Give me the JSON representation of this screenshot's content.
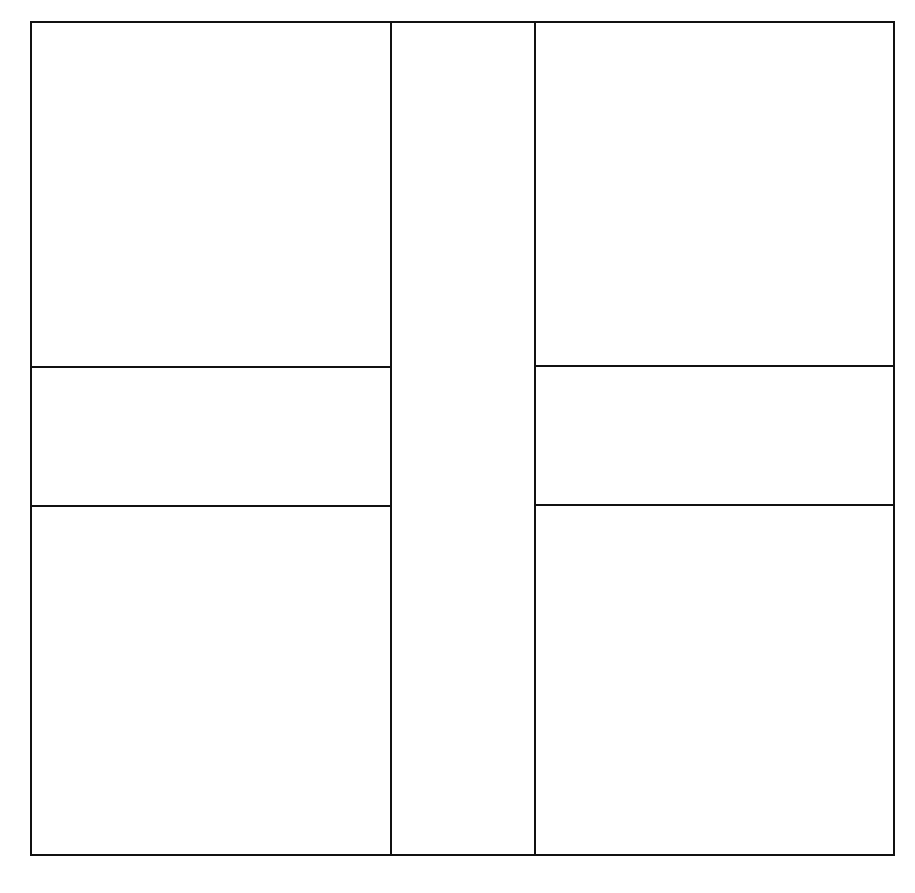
{
  "diagram": {
    "type": "grid-layout",
    "stroke_color": "#111111",
    "background_color": "#ffffff",
    "stroke_width": 2,
    "outer_frame": {
      "x1": 31,
      "y1": 22,
      "x2": 894,
      "y2": 855
    },
    "center_column": {
      "x_left": 391,
      "x_right": 535
    },
    "left_column": {
      "x1": 31,
      "x2": 391,
      "dividers_y": [
        367,
        506
      ],
      "cells": [
        {
          "id": "left-top",
          "y1": 22,
          "y2": 367
        },
        {
          "id": "left-middle",
          "y1": 367,
          "y2": 506
        },
        {
          "id": "left-bottom",
          "y1": 506,
          "y2": 855
        }
      ]
    },
    "right_column": {
      "x1": 535,
      "x2": 894,
      "dividers_y": [
        366,
        505
      ],
      "cells": [
        {
          "id": "right-top",
          "y1": 22,
          "y2": 366
        },
        {
          "id": "right-middle",
          "y1": 366,
          "y2": 505
        },
        {
          "id": "right-bottom",
          "y1": 505,
          "y2": 855
        }
      ]
    }
  }
}
